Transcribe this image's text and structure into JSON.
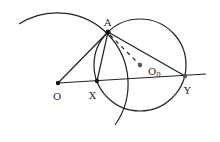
{
  "diagram": {
    "points": {
      "A": {
        "label": "A",
        "x": 108,
        "y": 32
      },
      "O": {
        "label": "O",
        "x": 58,
        "y": 83
      },
      "X": {
        "label": "X",
        "x": 97,
        "y": 81
      },
      "Y": {
        "label": "Y",
        "x": 185,
        "y": 76
      },
      "O0": {
        "label": "O",
        "sub": "0",
        "x": 140,
        "y": 65
      }
    },
    "colors": {
      "stroke": "#222222",
      "point": "#111111",
      "center_point": "#555555"
    }
  }
}
